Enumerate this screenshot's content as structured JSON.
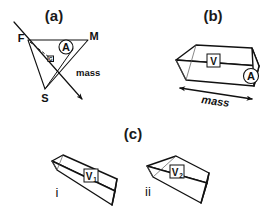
{
  "figure": {
    "background_color": "#ffffff",
    "ink_color": "#111111"
  },
  "panels": {
    "a": {
      "label": "(a)",
      "vertices": {
        "F": "F",
        "M": "M",
        "S": "S",
        "G": "G"
      },
      "angle_marker": "A",
      "vector_label": "mass"
    },
    "b": {
      "label": "(b)",
      "volume_label": "V",
      "area_label": "A",
      "mass_label": "mass"
    },
    "c": {
      "label": "(c)",
      "items": [
        {
          "roman": "i",
          "volume_label": "V",
          "volume_sub": "1"
        },
        {
          "roman": "ii",
          "volume_label": "V",
          "volume_sub": "2"
        }
      ]
    }
  }
}
